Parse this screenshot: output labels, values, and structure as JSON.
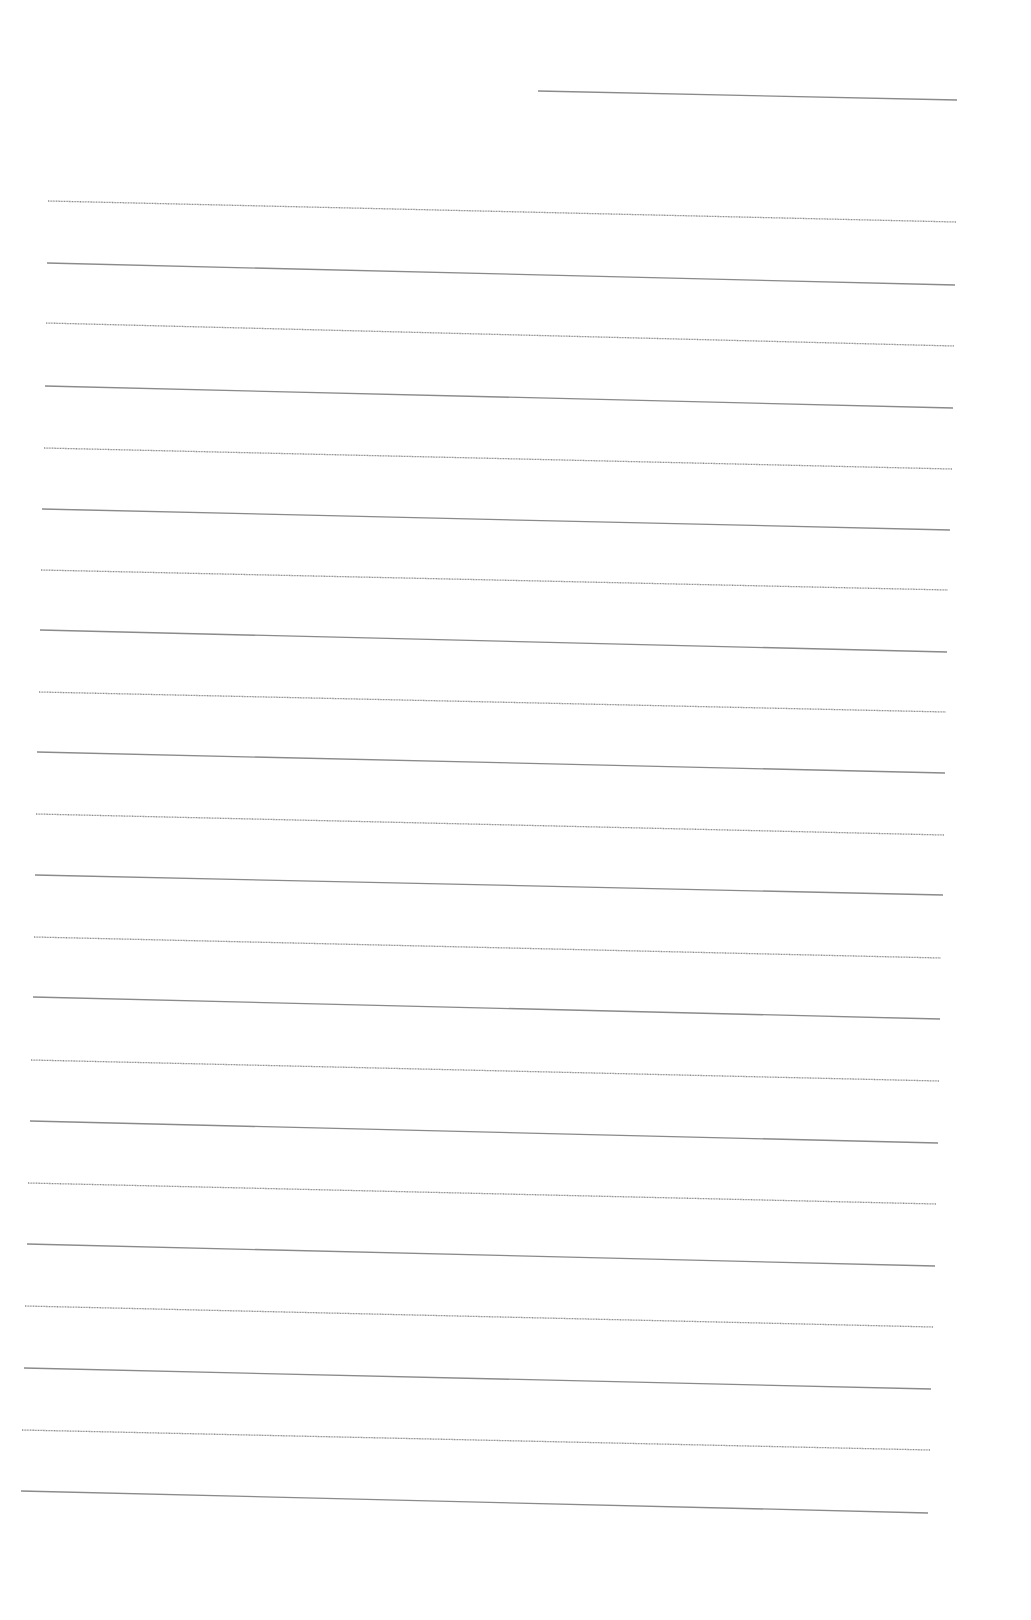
{
  "document": {
    "type": "ruled-notepaper",
    "background": "#ffffff",
    "line_color": "#8a8a8a",
    "date_line": {
      "x1": 538,
      "y1": 91,
      "x2": 957,
      "y2": 100
    },
    "ruled_lines": [
      {
        "x1": 48,
        "y1": 201,
        "x2": 956,
        "y2": 222
      },
      {
        "x1": 47,
        "y1": 263,
        "x2": 955,
        "y2": 285
      },
      {
        "x1": 46,
        "y1": 323,
        "x2": 954,
        "y2": 346
      },
      {
        "x1": 45,
        "y1": 386,
        "x2": 953,
        "y2": 408
      },
      {
        "x1": 44,
        "y1": 448,
        "x2": 952,
        "y2": 469
      },
      {
        "x1": 42,
        "y1": 509,
        "x2": 950,
        "y2": 530
      },
      {
        "x1": 41,
        "y1": 570,
        "x2": 948,
        "y2": 590
      },
      {
        "x1": 40,
        "y1": 630,
        "x2": 947,
        "y2": 652
      },
      {
        "x1": 39,
        "y1": 692,
        "x2": 946,
        "y2": 712
      },
      {
        "x1": 37,
        "y1": 752,
        "x2": 945,
        "y2": 773
      },
      {
        "x1": 36,
        "y1": 814,
        "x2": 944,
        "y2": 835
      },
      {
        "x1": 35,
        "y1": 875,
        "x2": 943,
        "y2": 895
      },
      {
        "x1": 34,
        "y1": 937,
        "x2": 941,
        "y2": 958
      },
      {
        "x1": 33,
        "y1": 997,
        "x2": 940,
        "y2": 1019
      },
      {
        "x1": 31,
        "y1": 1060,
        "x2": 939,
        "y2": 1081
      },
      {
        "x1": 30,
        "y1": 1121,
        "x2": 938,
        "y2": 1143
      },
      {
        "x1": 28,
        "y1": 1183,
        "x2": 936,
        "y2": 1204
      },
      {
        "x1": 27,
        "y1": 1244,
        "x2": 935,
        "y2": 1266
      },
      {
        "x1": 25,
        "y1": 1306,
        "x2": 933,
        "y2": 1327
      },
      {
        "x1": 24,
        "y1": 1368,
        "x2": 931,
        "y2": 1389
      },
      {
        "x1": 22,
        "y1": 1430,
        "x2": 930,
        "y2": 1450
      },
      {
        "x1": 21,
        "y1": 1491,
        "x2": 928,
        "y2": 1513
      }
    ]
  }
}
